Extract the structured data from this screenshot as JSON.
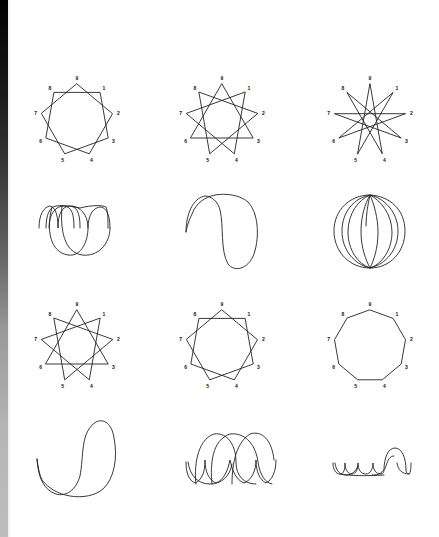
{
  "page": {
    "edge_strip": {
      "top_color": "#000000",
      "bottom_color": "#bdbdbd"
    },
    "stroke_color": "#222222"
  },
  "polygons": [
    {
      "id": "row1-col1",
      "type": "star-polygon",
      "notation": "{9/2}",
      "center": [
        77,
        120
      ],
      "radius": 36,
      "label_radius": 42,
      "step": 2,
      "labels": [
        "9",
        "1",
        "2",
        "3",
        "4",
        "5",
        "6",
        "7",
        "8"
      ]
    },
    {
      "id": "row1-col2",
      "type": "triangle",
      "notation": "{9/3}",
      "center": [
        222,
        120
      ],
      "radius": 36,
      "label_radius": 42,
      "step": 3,
      "labels": [
        "9",
        "1",
        "2",
        "3",
        "4",
        "5",
        "6",
        "7",
        "8"
      ]
    },
    {
      "id": "row1-col3",
      "type": "star-polygon",
      "notation": "{9/4}",
      "center": [
        370,
        120
      ],
      "radius": 36,
      "label_radius": 42,
      "step": 4,
      "labels": [
        "9",
        "1",
        "2",
        "3",
        "4",
        "5",
        "6",
        "7",
        "8"
      ]
    },
    {
      "id": "row3-col1",
      "type": "triangle",
      "notation": "{9/3}",
      "center": [
        77,
        346
      ],
      "radius": 36,
      "label_radius": 42,
      "step": 3,
      "labels": [
        "9",
        "1",
        "2",
        "3",
        "4",
        "5",
        "6",
        "7",
        "8"
      ]
    },
    {
      "id": "row3-col2",
      "type": "star-polygon",
      "notation": "{9/2}",
      "center": [
        222,
        346
      ],
      "radius": 36,
      "label_radius": 42,
      "step": 2,
      "labels": [
        "9",
        "1",
        "2",
        "3",
        "4",
        "5",
        "6",
        "7",
        "8"
      ]
    },
    {
      "id": "row3-col3",
      "type": "nonagon",
      "notation": "{9/1}",
      "center": [
        370,
        346
      ],
      "radius": 36,
      "label_radius": 42,
      "step": 1,
      "labels": [
        "9",
        "1",
        "2",
        "3",
        "4",
        "5",
        "6",
        "7",
        "8"
      ]
    }
  ],
  "curves": [
    {
      "id": "row2-col1",
      "description": "looped cycloid-like curve with cusps",
      "path": "M39,228 C39,214 44,207 50,206 C55,207 58,214 58,228 C58,214 62,207 69,206 C76,206 80,212 80,226 L80,228 M46,228 C46,214 50,207 56,206 C64,205 72,206 80,208 C92,205 102,205 106,207 C108,212 108,220 108,228 M49,228 C49,213 56,206 64,206 C72,207 74,214 74,228 M88,228 C88,214 94,207 101,207 C106,208 110,214 110,228 M52,207 C46,230 50,252 68,255 C82,257 88,240 88,228 C88,214 80,207 72,206 M62,206 C60,230 64,252 82,255 C98,257 110,244 110,228"
    },
    {
      "id": "row2-col2",
      "description": "hooked loop curve",
      "path": "M186,232 C186,214 193,198 205,196 C212,196 218,202 220,210 C224,226 220,250 228,264 C234,272 248,270 254,254 C260,236 258,212 248,202 C240,195 226,193 215,195 C205,197 196,203 192,214 C189,220 187,226 186,232"
    },
    {
      "id": "row2-col3",
      "description": "spherical multi-loop curve",
      "path": "M366,226 C366,214 368,204 370,195 C390,196 405,210 405,231 C405,252 390,268 370,268 C350,268 334,252 334,231 C334,210 350,195 370,195 C380,200 392,214 392,232 C392,250 382,264 370,268 C358,264 348,250 348,232 C348,214 358,200 370,195 C374,204 378,218 378,232 C378,248 374,260 370,268 C366,260 361,248 361,232 C361,216 365,204 370,195 C384,198 398,212 398,231 C398,250 386,264 370,268 C354,264 342,250 342,231 C342,212 354,198 370,195"
    },
    {
      "id": "row4-col1",
      "description": "hooked loop curve (reversed)",
      "path": "M37,459 C38,478 44,490 56,494 C66,497 76,490 80,476 C84,456 80,432 96,422 C104,418 112,424 114,438 C118,458 114,478 104,488 C96,496 82,498 70,496 C58,494 48,488 42,480 C39,474 38,466 37,459"
    },
    {
      "id": "row4-col2",
      "description": "cycloid with arches and bottom cusps",
      "path": "M186,462 C186,474 189,480 195,483 C202,480 205,472 205,460 C205,472 209,480 216,483 C224,480 228,470 230,460 C232,470 236,480 244,483 C252,480 256,470 256,460 C256,472 260,480 266,483 C272,480 276,472 276,460 M188,462 C190,476 198,484 210,484 C222,484 230,476 232,464 M196,484 C194,470 196,440 214,434 C228,432 236,446 236,462 C236,476 244,484 256,484 M212,484 C210,464 212,440 230,434 C246,432 256,446 258,462 C260,476 266,483 272,484 M232,484 C232,470 234,444 250,434 C262,430 272,440 274,460"
    },
    {
      "id": "row4-col3",
      "description": "small scallops with central arch",
      "path": "M333,463 C333,470 336,474 340,474 C344,474 345,469 345,463 C345,470 348,474 352,474 C356,474 358,469 358,463 C358,470 361,474 366,474 C370,474 373,469 373,463 C373,470 376,474 381,474 C383,474 384,472 384,470 C384,458 388,448 395,448 C402,448 406,458 406,470 C406,472 407,474 409,474 C410,474 411,470 411,463 M335,463 C336,471 340,475 346,475 C352,475 356,471 358,466 M372,475 C378,476 384,472 386,466 C388,459 390,456 394,456 M397,463 C398,470 402,474 409,474 M340,474 C350,476 366,476 384,475"
    }
  ]
}
